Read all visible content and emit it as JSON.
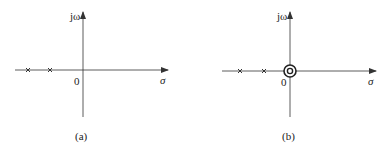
{
  "diagrams": [
    {
      "id": "a",
      "caption": "(a)",
      "axis_labels": {
        "imag": "jω",
        "real": "σ",
        "origin": "0"
      },
      "poles": [
        {
          "x": 28,
          "y": 70
        },
        {
          "x": 50,
          "y": 70
        }
      ],
      "zeros": []
    },
    {
      "id": "b",
      "caption": "(b)",
      "axis_labels": {
        "imag": "jω",
        "real": "σ",
        "origin": "0"
      },
      "poles": [
        {
          "x": 240,
          "y": 71
        },
        {
          "x": 264,
          "y": 71
        }
      ],
      "zeros": [
        {
          "x": 290,
          "y": 71,
          "multiplicity": 2
        }
      ]
    }
  ],
  "colors": {
    "stroke": "#333333",
    "background": "#ffffff"
  }
}
